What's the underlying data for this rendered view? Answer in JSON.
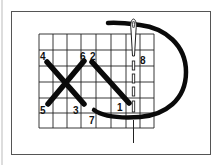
{
  "diagram": {
    "colors": {
      "background": "#ffffff",
      "frame": "#555555",
      "grid": "#222222",
      "thread": "#0a0a0a",
      "needle": "#222222"
    },
    "grid": {
      "columns_x": [
        39,
        53,
        67,
        81,
        96,
        111,
        126,
        140,
        154
      ],
      "rows_y": [
        34,
        50,
        66,
        82,
        98,
        113,
        128
      ]
    },
    "stitches": [
      {
        "name": "stitch-4-3",
        "from_label": "4",
        "to_label": "3"
      },
      {
        "name": "stitch-6-5",
        "from_label": "6",
        "to_label": "5"
      },
      {
        "name": "stitch-2-1",
        "from_label": "2",
        "to_label": "1"
      }
    ],
    "labels": [
      {
        "text": "4",
        "x": 40,
        "y": 60
      },
      {
        "text": "6",
        "x": 80,
        "y": 60
      },
      {
        "text": "2",
        "x": 90,
        "y": 60
      },
      {
        "text": "5",
        "x": 40,
        "y": 114
      },
      {
        "text": "3",
        "x": 73,
        "y": 114
      },
      {
        "text": "7",
        "x": 89,
        "y": 124
      },
      {
        "text": "1",
        "x": 117,
        "y": 111
      },
      {
        "text": "8",
        "x": 140,
        "y": 64
      }
    ]
  }
}
